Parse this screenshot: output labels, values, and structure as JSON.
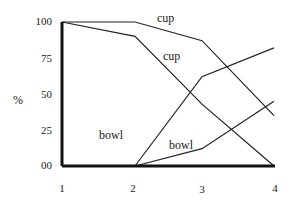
{
  "chart_data": {
    "type": "line",
    "title": "",
    "xlabel": "",
    "ylabel": "%",
    "x": [
      1,
      2,
      3,
      4
    ],
    "xtick_labels": [
      "1",
      "2",
      "3",
      "4"
    ],
    "ytick_labels": [
      "00",
      "25",
      "50",
      "75",
      "100"
    ],
    "yticks": [
      0,
      25,
      50,
      75,
      100
    ],
    "ylim": [
      0,
      100
    ],
    "xlim": [
      1,
      4
    ],
    "grid": false,
    "legend": "inline labels",
    "series": [
      {
        "name": "cup",
        "label_position": "upper",
        "x": [
          1,
          2,
          3,
          4
        ],
        "values": [
          100,
          100,
          87,
          35
        ]
      },
      {
        "name": "cup",
        "label_position": "lower",
        "x": [
          1,
          2,
          3,
          4
        ],
        "values": [
          100,
          90,
          43,
          0
        ]
      },
      {
        "name": "bowl",
        "label_position": "upper",
        "x": [
          2,
          3,
          4
        ],
        "values": [
          0,
          62,
          82
        ]
      },
      {
        "name": "bowl",
        "label_position": "lower",
        "x": [
          2,
          3,
          4
        ],
        "values": [
          0,
          12,
          45
        ]
      }
    ]
  },
  "labels": {
    "ylabel": "%",
    "cup_upper": "cup",
    "cup_lower": "cup",
    "bowl_upper": "bowl",
    "bowl_lower": "bowl"
  },
  "axis": {
    "y": [
      "100",
      "75",
      "50",
      "25",
      "00"
    ],
    "x": [
      "1",
      "2",
      "3",
      "4"
    ]
  }
}
